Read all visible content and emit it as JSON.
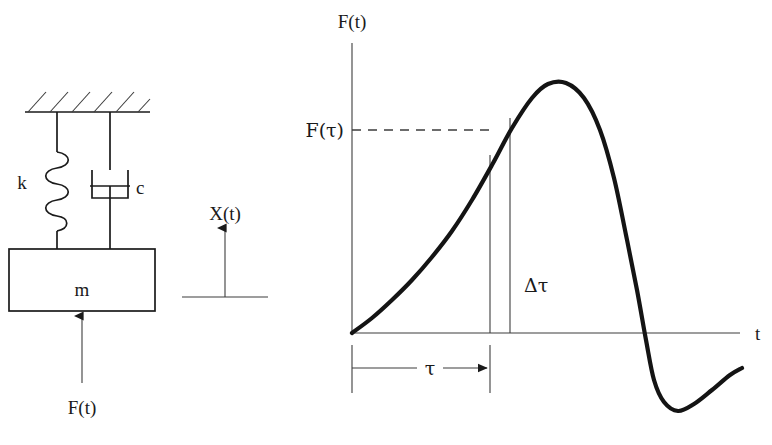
{
  "figure": {
    "ink_color": "#1a1a1a",
    "background_color": "#ffffff",
    "thin_line_color": "#3d3d3d"
  },
  "system_diagram": {
    "name": "mass-spring-damper",
    "ceiling_label": "fixed-support-hatching",
    "spring_label": "k",
    "damper_label": "c",
    "mass_label": "m",
    "force_label": "F(t)",
    "displacement_label": "X(t)",
    "spring_coils": 5,
    "hatch_marks": 6
  },
  "plot": {
    "y_axis_label": "F(t)",
    "x_axis_label": "t",
    "value_label": "F(τ)",
    "tau_label": "τ",
    "delta_tau_label": "Δτ",
    "axis_origin": {
      "x": 352,
      "y": 333
    }
  },
  "chart_data": {
    "type": "line",
    "title": "F(t)",
    "xlabel": "t",
    "ylabel": "F(t)",
    "grid": false,
    "legend": null,
    "axis_origin_px": {
      "x": 352,
      "y": 333
    },
    "xlim_px": [
      352,
      740
    ],
    "ylim_px": [
      40,
      420
    ],
    "annotations": [
      {
        "label": "F(τ)",
        "type": "horizontal-dashed-value-line",
        "y_px": 130,
        "x_from_px": 352,
        "x_to_px": 493
      },
      {
        "label": "τ",
        "type": "horizontal-dimension-with-arrow",
        "x_from_px": 352,
        "x_to_px": 490,
        "y_px": 368
      },
      {
        "label": "Δτ",
        "type": "vertical-strip",
        "x_from_px": 490,
        "x_to_px": 510,
        "y_top_px": 118,
        "y_bottom_px": 333
      }
    ],
    "series": [
      {
        "name": "F(t)",
        "description": "Arbitrary pulse: rises convexly from origin, peaks, falls steeply through zero to a trough, then rises again",
        "points_px": [
          [
            352,
            333
          ],
          [
            372,
            318
          ],
          [
            392,
            300
          ],
          [
            412,
            280
          ],
          [
            432,
            257
          ],
          [
            452,
            231
          ],
          [
            472,
            200
          ],
          [
            492,
            165
          ],
          [
            512,
            128
          ],
          [
            532,
            98
          ],
          [
            548,
            84
          ],
          [
            566,
            83
          ],
          [
            584,
            98
          ],
          [
            600,
            130
          ],
          [
            614,
            178
          ],
          [
            626,
            235
          ],
          [
            637,
            290
          ],
          [
            646,
            340
          ],
          [
            654,
            380
          ],
          [
            664,
            402
          ],
          [
            678,
            411
          ],
          [
            694,
            404
          ],
          [
            712,
            390
          ],
          [
            730,
            375
          ],
          [
            742,
            368
          ]
        ],
        "key_features": {
          "start": [
            352,
            333
          ],
          "peak": [
            556,
            82
          ],
          "zero_crossing": [
            637,
            333
          ],
          "trough": [
            680,
            411
          ],
          "end": [
            742,
            368
          ]
        }
      }
    ]
  }
}
